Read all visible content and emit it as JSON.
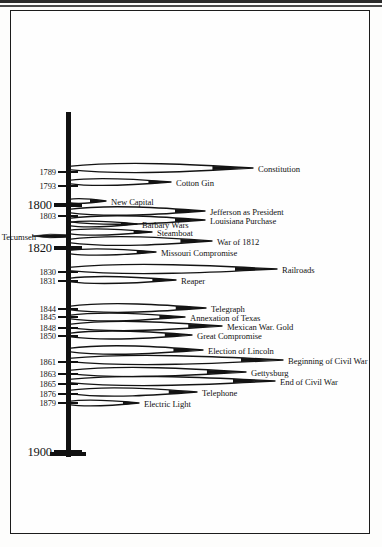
{
  "figure": {
    "type": "timeline",
    "orientation": "vertical",
    "axis_start_year": 1789,
    "axis_end_year": 1900,
    "axis_top_label": "",
    "axis_bottom_label": "1900"
  },
  "year_ticks": [
    {
      "year": "1789",
      "y": 172,
      "major": false
    },
    {
      "year": "1793",
      "y": 186,
      "major": false
    },
    {
      "year": "1800",
      "y": 205,
      "major": true
    },
    {
      "year": "1803",
      "y": 216,
      "major": false
    },
    {
      "year": "1820",
      "y": 248,
      "major": true
    },
    {
      "year": "1830",
      "y": 272,
      "major": false
    },
    {
      "year": "1831",
      "y": 281,
      "major": false
    },
    {
      "year": "1844",
      "y": 309,
      "major": false
    },
    {
      "year": "1845",
      "y": 317,
      "major": false
    },
    {
      "year": "1848",
      "y": 328,
      "major": false
    },
    {
      "year": "1850",
      "y": 336,
      "major": false
    },
    {
      "year": "1861",
      "y": 362,
      "major": false
    },
    {
      "year": "1863",
      "y": 374,
      "major": false
    },
    {
      "year": "1865",
      "y": 384,
      "major": false
    },
    {
      "year": "1876",
      "y": 394,
      "major": false
    },
    {
      "year": "1879",
      "y": 403,
      "major": false
    },
    {
      "year": "1900",
      "y": 452,
      "major": true
    }
  ],
  "events": [
    {
      "label": "Constitution",
      "tip_x": 253,
      "tip_y": 168,
      "lx": 258,
      "ly": 165,
      "side": "right"
    },
    {
      "label": "Cotton Gin",
      "tip_x": 171,
      "tip_y": 182,
      "lx": 176,
      "ly": 179,
      "side": "right"
    },
    {
      "label": "New Capital",
      "tip_x": 106,
      "tip_y": 201,
      "lx": 111,
      "ly": 198,
      "side": "right"
    },
    {
      "label": "Jefferson as President",
      "tip_x": 205,
      "tip_y": 211,
      "lx": 210,
      "ly": 208,
      "side": "right"
    },
    {
      "label": "Louisiana Purchase",
      "tip_x": 205,
      "tip_y": 220,
      "lx": 210,
      "ly": 217,
      "side": "right"
    },
    {
      "label": "Barbary Wars",
      "tip_x": 137,
      "tip_y": 224,
      "lx": 142,
      "ly": 221,
      "side": "right"
    },
    {
      "label": "Steamboat",
      "tip_x": 152,
      "tip_y": 232,
      "lx": 157,
      "ly": 229,
      "side": "right"
    },
    {
      "label": "Tecumseh",
      "tip_x": 66,
      "tip_y": 236,
      "lx": 37,
      "ly": 233,
      "side": "left"
    },
    {
      "label": "War of 1812",
      "tip_x": 212,
      "tip_y": 241,
      "lx": 217,
      "ly": 238,
      "side": "right"
    },
    {
      "label": "Missouri Compromise",
      "tip_x": 156,
      "tip_y": 252,
      "lx": 161,
      "ly": 249,
      "side": "right"
    },
    {
      "label": "Railroads",
      "tip_x": 277,
      "tip_y": 269,
      "lx": 282,
      "ly": 266,
      "side": "right"
    },
    {
      "label": "Reaper",
      "tip_x": 176,
      "tip_y": 280,
      "lx": 181,
      "ly": 277,
      "side": "right"
    },
    {
      "label": "Telegraph",
      "tip_x": 206,
      "tip_y": 308,
      "lx": 211,
      "ly": 305,
      "side": "right"
    },
    {
      "label": "Annexation of Texas",
      "tip_x": 185,
      "tip_y": 317,
      "lx": 190,
      "ly": 314,
      "side": "right"
    },
    {
      "label": "Mexican War.  Gold",
      "tip_x": 222,
      "tip_y": 326,
      "lx": 227,
      "ly": 323,
      "side": "right"
    },
    {
      "label": "Great Compromise",
      "tip_x": 192,
      "tip_y": 335,
      "lx": 197,
      "ly": 332,
      "side": "right"
    },
    {
      "label": "Election of Lincoln",
      "tip_x": 203,
      "tip_y": 350,
      "lx": 208,
      "ly": 347,
      "side": "right"
    },
    {
      "label": "Beginning of Civil War",
      "tip_x": 283,
      "tip_y": 360,
      "lx": 288,
      "ly": 357,
      "side": "right"
    },
    {
      "label": "Gettysburg",
      "tip_x": 246,
      "tip_y": 372,
      "lx": 251,
      "ly": 369,
      "side": "right"
    },
    {
      "label": "End of Civil War",
      "tip_x": 275,
      "tip_y": 381,
      "lx": 280,
      "ly": 378,
      "side": "right"
    },
    {
      "label": "Telephone",
      "tip_x": 197,
      "tip_y": 392,
      "lx": 202,
      "ly": 389,
      "side": "right"
    },
    {
      "label": "Electric Light",
      "tip_x": 139,
      "tip_y": 403,
      "lx": 144,
      "ly": 400,
      "side": "right"
    }
  ],
  "colors": {
    "ink": "#131313",
    "paper": "#fefefe",
    "frame": "#1c1c1c"
  }
}
